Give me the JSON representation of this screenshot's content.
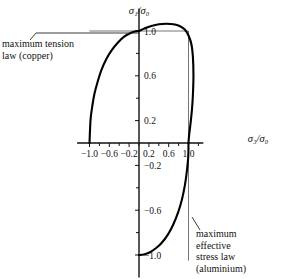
{
  "chart_data": {
    "type": "line",
    "title": "",
    "subtitle": "",
    "xlabel": "σ₃/σ₀",
    "ylabel": "σ₁/σ₀",
    "xlim": [
      -1.25,
      1.3
    ],
    "ylim": [
      -1.2,
      1.2
    ],
    "grid": false,
    "legend_position": "annotations",
    "xticks": [
      -1.0,
      -0.6,
      -0.2,
      0.2,
      0.6,
      1.0
    ],
    "xtick_labels": [
      "-1.0",
      "-0.6",
      "-0.2",
      "0.2",
      "0.6",
      "1.0"
    ],
    "xminor_ticks": [
      -0.8,
      -0.4,
      0.0,
      0.4,
      0.8,
      1.2
    ],
    "yticks": [
      1.0,
      0.6,
      0.2,
      -0.2,
      -0.6,
      -1.0
    ],
    "ytick_labels": [
      "1.0",
      "0.6",
      "0.2",
      "-0.2",
      "-0.6",
      "-1.0"
    ],
    "yminor_ticks": [
      0.8,
      0.4,
      0.0,
      -0.4,
      -0.8
    ],
    "guide_lines": [
      {
        "name": "horizontal-unity-guide",
        "from": [
          -1.0,
          1.0
        ],
        "to": [
          1.0,
          1.0
        ]
      },
      {
        "name": "vertical-unity-guide",
        "from": [
          1.0,
          1.0
        ],
        "to": [
          1.0,
          -1.05
        ]
      }
    ],
    "series": [
      {
        "name": "maximum tension law (copper)",
        "material": "copper",
        "description": "quarter ellipse rising from (-1.0, 0) to (0, 1.0)",
        "points": [
          [
            -1.0,
            0.0
          ],
          [
            -0.98,
            0.2
          ],
          [
            -0.95,
            0.31
          ],
          [
            -0.9,
            0.44
          ],
          [
            -0.84,
            0.54
          ],
          [
            -0.76,
            0.65
          ],
          [
            -0.66,
            0.75
          ],
          [
            -0.55,
            0.83
          ],
          [
            -0.42,
            0.9
          ],
          [
            -0.3,
            0.95
          ],
          [
            -0.18,
            0.98
          ],
          [
            -0.08,
            0.995
          ],
          [
            0.0,
            1.0
          ]
        ]
      },
      {
        "name": "yield-locus-upper-right",
        "material": "",
        "description": "locus bulging slightly past unity across the first quadrant from (0, 1.0) to (1.0, 0)",
        "points": [
          [
            0.0,
            1.0
          ],
          [
            0.12,
            1.025
          ],
          [
            0.25,
            1.045
          ],
          [
            0.4,
            1.06
          ],
          [
            0.55,
            1.065
          ],
          [
            0.7,
            1.06
          ],
          [
            0.82,
            1.045
          ],
          [
            0.92,
            1.015
          ],
          [
            1.0,
            0.96
          ],
          [
            1.06,
            0.88
          ],
          [
            1.09,
            0.76
          ],
          [
            1.1,
            0.6
          ],
          [
            1.09,
            0.44
          ],
          [
            1.07,
            0.3
          ],
          [
            1.04,
            0.17
          ],
          [
            1.01,
            0.06
          ],
          [
            1.0,
            0.0
          ]
        ]
      },
      {
        "name": "maximum effective stress law (aluminium)",
        "material": "aluminium",
        "description": "quarter ellipse rising from (0, -1.0) to (1.0, 0)",
        "points": [
          [
            0.0,
            -1.0
          ],
          [
            0.1,
            -0.995
          ],
          [
            0.22,
            -0.975
          ],
          [
            0.34,
            -0.94
          ],
          [
            0.46,
            -0.89
          ],
          [
            0.58,
            -0.82
          ],
          [
            0.69,
            -0.73
          ],
          [
            0.79,
            -0.62
          ],
          [
            0.87,
            -0.5
          ],
          [
            0.93,
            -0.37
          ],
          [
            0.97,
            -0.24
          ],
          [
            0.995,
            -0.12
          ],
          [
            1.0,
            0.0
          ]
        ]
      }
    ],
    "annotations": [
      {
        "name": "maximum-tension-annotation",
        "text": "maximum tension\nlaw (copper)",
        "anchor_point": [
          0.0,
          1.0
        ],
        "position": "upper-left"
      },
      {
        "name": "maximum-effective-stress-annotation",
        "text": "maximum\neffective\nstress law\n(aluminium)",
        "anchor_point": [
          0.62,
          -0.66
        ],
        "position": "lower-right"
      }
    ]
  },
  "axes": {
    "x_label": "σ₃/σ₀",
    "y_label": "σ₁/σ₀",
    "x_tick_labels": [
      "-1.0",
      "-0.6",
      "-0.2",
      "0.2",
      "0.6",
      "1.0"
    ],
    "y_tick_labels": [
      "1.0",
      "0.6",
      "0.2",
      "-0.2",
      "-0.6",
      "-1.0"
    ]
  },
  "annotations": {
    "tension_law": "maximum tension\nlaw (copper)",
    "effective_stress_law": "maximum\neffective\nstress law\n(aluminium)"
  },
  "colors": {
    "background": "#ffffff",
    "curve": "#000000",
    "axis": "#111111",
    "guide": "#3a3a3a",
    "text": "#111111"
  }
}
